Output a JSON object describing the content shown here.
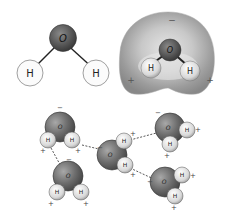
{
  "figure": {
    "panel_a": {
      "description": "Ball-and-stick model of a water molecule",
      "oxygen_label": "O",
      "hydrogen_left_label": "H",
      "hydrogen_right_label": "H"
    },
    "panel_b": {
      "description": "Electrostatic potential map of a water molecule",
      "oxygen_label": "O",
      "hydrogen_left_label": "H",
      "hydrogen_right_label": "H",
      "negative_sign": "−",
      "positive_left_sign": "+",
      "positive_right_sign": "+"
    },
    "panel_c": {
      "description": "Hydrogen bonding between water molecules",
      "molecules": [
        {
          "o": "O",
          "h1": "H",
          "h2": "H",
          "charge_o": "−",
          "charge_h1": "+",
          "charge_h2": "+"
        },
        {
          "o": "O",
          "h1": "H",
          "h2": "H",
          "charge_o": "−",
          "charge_h1": "+",
          "charge_h2": "+"
        },
        {
          "o": "O",
          "h1": "H",
          "h2": "H",
          "charge_o": "−",
          "charge_h1": "+",
          "charge_h2": "+"
        },
        {
          "o": "O",
          "h1": "H",
          "h2": "H",
          "charge_o": "−",
          "charge_h1": "+",
          "charge_h2": "+"
        },
        {
          "o": "O",
          "h1": "H",
          "h2": "H",
          "charge_o": "−",
          "charge_h1": "+",
          "charge_h2": "+"
        }
      ]
    }
  },
  "colors": {
    "oxygen": "#4a4a4a",
    "hydrogen": "#f4f4f4",
    "bond": "#222222",
    "potential_map": "#9a9a9a"
  }
}
